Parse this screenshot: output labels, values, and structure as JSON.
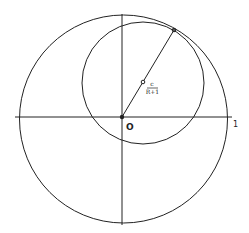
{
  "diagram": {
    "colors": {
      "stroke": "#222222",
      "background": "#ffffff"
    },
    "labels": {
      "origin": "O",
      "unit": "1",
      "center_numerator": "c",
      "center_denominator": "R+1"
    },
    "shapes": {
      "large_circle": {
        "cx": 123.5,
        "cy": 119,
        "r": 104
      },
      "small_circle": {
        "cx": 143,
        "cy": 83,
        "r": 61
      },
      "origin_point": {
        "x": 122,
        "y": 117
      },
      "center_point": {
        "x": 143,
        "y": 82
      },
      "tangent_point": {
        "x": 174,
        "y": 30
      },
      "x_axis": {
        "x1": 15,
        "x2": 232,
        "y": 117
      },
      "y_axis": {
        "x": 122,
        "y1": 14,
        "y2": 225
      }
    }
  }
}
